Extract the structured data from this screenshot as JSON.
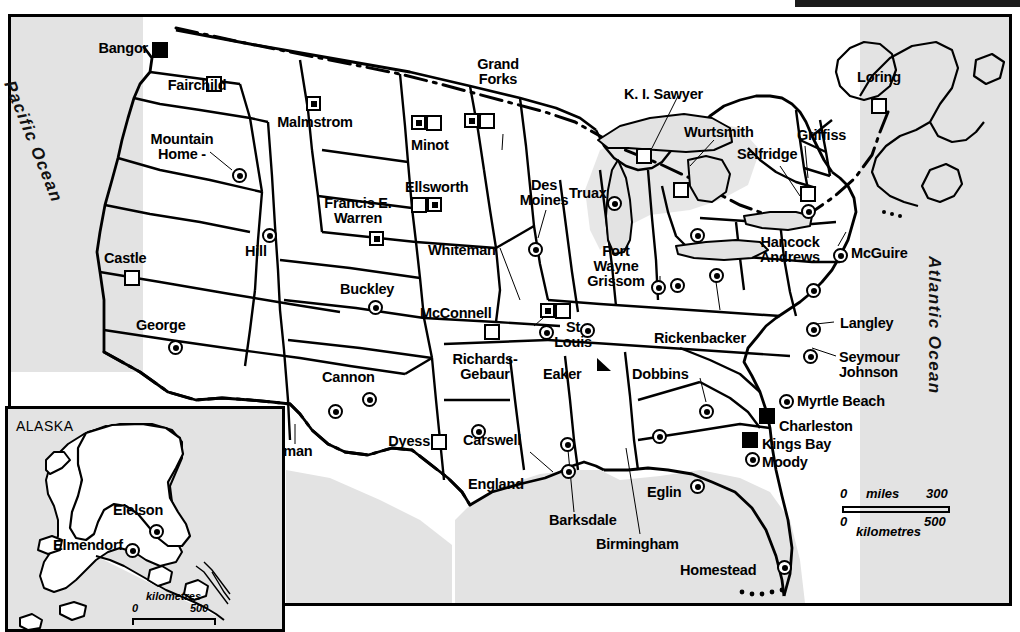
{
  "map": {
    "title": "United States military bases map",
    "oceans": [
      {
        "name": "Pacific Ocean",
        "label": "Pacific Ocean"
      },
      {
        "name": "Atlantic Ocean",
        "label": "Atlantic Ocean"
      }
    ],
    "inset": {
      "title": "ALASKA",
      "bases": [
        {
          "label": "Eielson",
          "symbol": "circle-dot"
        },
        {
          "label": "Elmendorf",
          "symbol": "circle-dot"
        }
      ],
      "scale": {
        "unit": "kilometres",
        "min": "0",
        "max": "500"
      }
    },
    "scale": {
      "miles_label": "miles",
      "miles_min": "0",
      "miles_max": "300",
      "km_label": "kilometres",
      "km_min": "0",
      "km_max": "500"
    },
    "symbol_legend": {
      "circle-dot": "air force base",
      "filled-square": "navy base",
      "square-in-square": "missile / strategic site",
      "diagonal-box": "air national guard / reserve",
      "solid-triangle": "installation"
    },
    "bases": [
      {
        "label": "Bangor",
        "symbol": "filled-square"
      },
      {
        "label": "Fairchild",
        "symbol": "diagonal-box"
      },
      {
        "label": "Malmstrom",
        "symbol": "square-in-square"
      },
      {
        "label": "Mountain\nHome -",
        "symbol": "circle-dot"
      },
      {
        "label": "Grand\nForks",
        "symbol": "square-in-square+diagonal-box"
      },
      {
        "label": "Minot",
        "symbol": "square-in-square+diagonal-box"
      },
      {
        "label": "Ellsworth",
        "symbol": "diagonal-box+square-in-square"
      },
      {
        "label": "Francis E.\nWarren",
        "symbol": "diagonal-box / square-in-square"
      },
      {
        "label": "Castle",
        "symbol": "diagonal-box"
      },
      {
        "label": "Hill",
        "symbol": "circle-dot"
      },
      {
        "label": "George",
        "symbol": "circle-dot"
      },
      {
        "label": "Buckley",
        "symbol": "circle-dot"
      },
      {
        "label": "Whiteman",
        "symbol": "circle-dot"
      },
      {
        "label": "Des\nMoines",
        "symbol": "circle-dot"
      },
      {
        "label": "Truax",
        "symbol": "circle-dot"
      },
      {
        "label": "K. I. Sawyer",
        "symbol": "diagonal-box"
      },
      {
        "label": "Wurtsmith",
        "symbol": "diagonal-box"
      },
      {
        "label": "Loring",
        "symbol": "diagonal-box"
      },
      {
        "label": "Griffiss",
        "symbol": "diagonal-box"
      },
      {
        "label": "Selfridge",
        "symbol": "circle-dot"
      },
      {
        "label": "Hancock\nAndrews",
        "symbol": "circle-dot"
      },
      {
        "label": "McGuire",
        "symbol": "circle-dot"
      },
      {
        "label": "Fort\nWayne\nGrissom",
        "symbol": "circle-dot"
      },
      {
        "label": "Rickenbacker",
        "symbol": "circle-dot"
      },
      {
        "label": "Langley",
        "symbol": "circle-dot"
      },
      {
        "label": "Seymour\nJohnson",
        "symbol": "circle-dot"
      },
      {
        "label": "Myrtle Beach",
        "symbol": "circle-dot"
      },
      {
        "label": "Charleston",
        "symbol": "filled-square"
      },
      {
        "label": "Kings Bay",
        "symbol": "filled-square"
      },
      {
        "label": "Moody",
        "symbol": "circle-dot"
      },
      {
        "label": "McConnell",
        "symbol": "square-in-square+diagonal-box"
      },
      {
        "label": "St\nLouis",
        "symbol": "circle-dot"
      },
      {
        "label": "Richards-\nGebaur",
        "symbol": "circle-dot"
      },
      {
        "label": "Eaker",
        "symbol": "solid-triangle"
      },
      {
        "label": "Dobbins",
        "symbol": "circle-dot"
      },
      {
        "label": "Cannon",
        "symbol": "circle-dot"
      },
      {
        "label": "Holloman",
        "symbol": "circle-dot"
      },
      {
        "label": "Dyess",
        "symbol": "diagonal-box"
      },
      {
        "label": "Carswell",
        "symbol": "circle-dot"
      },
      {
        "label": "England",
        "symbol": "circle-dot"
      },
      {
        "label": "Barksdale",
        "symbol": "circle-dot"
      },
      {
        "label": "Birmingham",
        "symbol": "circle-dot"
      },
      {
        "label": "Eglin",
        "symbol": "circle-dot"
      },
      {
        "label": "Homestead",
        "symbol": "circle-dot"
      }
    ]
  },
  "labels": {
    "bangor": "Bangor",
    "fairchild": "Fairchild",
    "malmstrom": "Malmstrom",
    "mountain_home": "Mountain\nHome -",
    "grand_forks": "Grand\nForks",
    "minot": "Minot",
    "ellsworth": "Ellsworth",
    "francis_warren": "Francis E.\nWarren",
    "castle": "Castle",
    "hill": "Hill",
    "george": "George",
    "buckley": "Buckley",
    "whiteman": "Whiteman",
    "des_moines": "Des\nMoines",
    "truax": "Truax",
    "ki_sawyer": "K. I. Sawyer",
    "wurtsmith": "Wurtsmith",
    "loring": "Loring",
    "griffiss": "Griffiss",
    "selfridge": "Selfridge",
    "hancock_andrews": "Hancock\nAndrews",
    "mcguire": "McGuire",
    "fort_wayne_grissom": "Fort\nWayne\nGrissom",
    "rickenbacker": "Rickenbacker",
    "langley": "Langley",
    "seymour_johnson": "Seymour\nJohnson",
    "myrtle_beach": "Myrtle Beach",
    "charleston": "Charleston",
    "kings_bay": "Kings Bay",
    "moody": "Moody",
    "mcconnell": "McConnell",
    "st_louis": "St\nLouis",
    "richards_gebaur": "Richards-\nGebaur",
    "eaker": "Eaker",
    "dobbins": "Dobbins",
    "cannon": "Cannon",
    "holloman": "Holloman",
    "dyess": "Dyess",
    "carswell": "Carswell",
    "england": "England",
    "barksdale": "Barksdale",
    "birmingham": "Birmingham",
    "eglin": "Eglin",
    "homestead": "Homestead",
    "pacific": "Pacific Ocean",
    "atlantic": "Atlantic Ocean",
    "alaska": "ALASKA",
    "eielson": "Eielson",
    "elmendorf": "Elmendorf"
  },
  "colors": {
    "ink": "#000000",
    "sea": "#e3e3e3",
    "land": "#ffffff"
  }
}
